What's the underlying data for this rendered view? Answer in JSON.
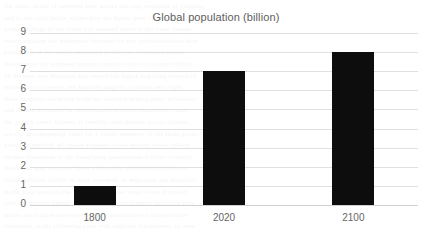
{
  "chart_data": {
    "type": "bar",
    "title": "Global population (billion)",
    "xlabel": "",
    "ylabel": "",
    "categories": [
      "1800",
      "2020",
      "2100"
    ],
    "values": [
      1,
      7,
      8
    ],
    "series": [
      {
        "name": "Global population (billion)",
        "values": [
          1,
          7,
          8
        ]
      }
    ],
    "ylim": [
      0,
      9
    ],
    "ytick_step": 1,
    "yticks": [
      "9",
      "8",
      "7",
      "6",
      "5",
      "4",
      "3",
      "2",
      "1",
      "0"
    ],
    "grid": "horizontal",
    "legend": "none",
    "bar_color": "#0d0d0d",
    "grid_color": "#dfdfdf",
    "text_color": "#666666",
    "title_color": "#5e5e5e",
    "background": "#ffffff"
  },
  "bleed_lines": [
    "the quiet record of numbers kept across the long centuries of counting",
    "and so the table below shows how the figure grew from year to year",
    "a small village in the north was counted twice in the same season",
    "which explains the difference between the two printed editions here",
    "population of the world, measured in billions of living persons",
    "the estimate for eighteen hundred remains close to a single billion",
    "by the year two thousand and twenty the figure had risen sevenfold",
    "projections to twenty one hundred suggest a plateau near eight",
    "these numbers are drawn from the standard demographic references",
    "and should be treated as approximations rather than exact counts",
    "the growth curve flattens as fertility rates decline across regions",
    "see the accompanying chart for a visual summary of the three points",
    "a note on method: all values rounded to the nearest whole billion",
    "further discussion of the underlying assumptions follows overleaf",
    "the reader may compare these with earlier published projections",
    "which differed chiefly in their treatment of migration and mortality",
    "in the final analysis the broad shape of the trend is not disputed",
    "only the precise timing of the turning point remains uncertain here",
    "tables and figures are reproduced by permission of the publisher",
    "continued on the following page with regional breakdowns by area"
  ]
}
